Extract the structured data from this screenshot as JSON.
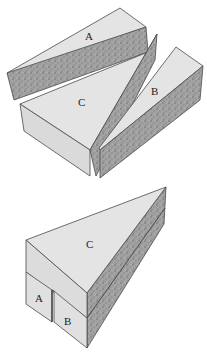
{
  "figure": {
    "title": "",
    "colors": {
      "light_face": "#e3e3e3",
      "front_face": "#dcdcdc",
      "stipple_face": "#9a9a9a",
      "stipple_dot": "#6f6f6f",
      "edge": "#4a4a4a",
      "background": "#ffffff"
    },
    "top_diagram": {
      "description": "Block cut into three pieces, exploded",
      "pieces": [
        {
          "id": "A",
          "label": "A"
        },
        {
          "id": "C",
          "label": "C"
        },
        {
          "id": "B",
          "label": "B"
        }
      ]
    },
    "bottom_diagram": {
      "description": "Pieces reassembled into a triangular prism",
      "pieces": [
        {
          "id": "C",
          "label": "C"
        },
        {
          "id": "A",
          "label": "A"
        },
        {
          "id": "B",
          "label": "B"
        }
      ]
    }
  }
}
